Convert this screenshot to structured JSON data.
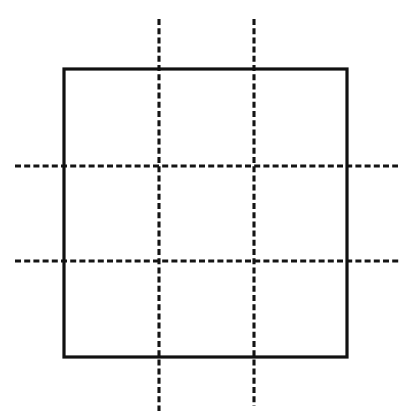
{
  "figure": {
    "background_color": "#ffffff",
    "stroke_color": "#111111",
    "dash_color": "#141414",
    "canvas": {
      "width": 418,
      "height": 416
    },
    "square": {
      "name": "solid-square",
      "style": "solid",
      "stroke_width": 3.2,
      "left": 64,
      "top": 69,
      "right": 347,
      "bottom": 357,
      "width": 283,
      "height": 288
    },
    "dashed_lines": {
      "dash_length": 6,
      "gap_length": 3.2,
      "stroke_width": 3.1,
      "vertical": [
        {
          "name": "vertical-dashed-line-1",
          "x": 159,
          "y_start": 19,
          "y_end": 411
        },
        {
          "name": "vertical-dashed-line-2",
          "x": 254,
          "y_start": 19,
          "y_end": 406
        }
      ],
      "horizontal": [
        {
          "name": "horizontal-dashed-line-1",
          "y": 166,
          "x_start": 15,
          "x_end": 398
        },
        {
          "name": "horizontal-dashed-line-2",
          "y": 261,
          "x_start": 15,
          "x_end": 400
        }
      ]
    },
    "grid": {
      "columns": 3,
      "rows": 3,
      "cells": 9
    },
    "intersections": [
      {
        "name": "intersection-v1-h1",
        "x": 159,
        "y": 166
      },
      {
        "name": "intersection-v2-h1",
        "x": 254,
        "y": 166
      },
      {
        "name": "intersection-v1-h2",
        "x": 159,
        "y": 261
      },
      {
        "name": "intersection-v2-h2",
        "x": 254,
        "y": 261
      }
    ],
    "labels": [],
    "annotations": []
  }
}
